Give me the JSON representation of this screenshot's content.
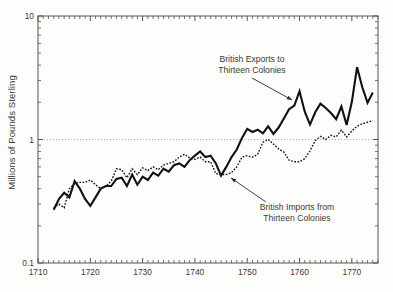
{
  "chart_data": {
    "type": "line",
    "title": "",
    "xlabel": "",
    "ylabel": "Millions of Pounds Sterling",
    "yscale": "log",
    "ylim": [
      0.1,
      10
    ],
    "xlim": [
      1710,
      1775
    ],
    "grid": "single horizontal dotted gridline at y=1",
    "y_tick_labels": [
      "10",
      "1",
      "0.1"
    ],
    "y_tick_values": [
      10,
      1,
      0.1
    ],
    "x_tick_labels": [
      "1710",
      "1720",
      "1730",
      "1740",
      "1750",
      "1760",
      "1770"
    ],
    "x_tick_values": [
      1710,
      1720,
      1730,
      1740,
      1750,
      1760,
      1770
    ],
    "x_minor_tick_interval": 1,
    "legend_position": "inline annotations with arrows",
    "annotations": [
      {
        "name": "exports-annotation",
        "text_line1": "British Exports to",
        "text_line2": "Thirteen Colonies",
        "arrow_from": [
          252,
          78
        ],
        "arrow_to": [
          292,
          100
        ]
      },
      {
        "name": "imports-annotation",
        "text_line1": "British Imports from",
        "text_line2": "Thirteen Colonies",
        "arrow_from": [
          266,
          202
        ],
        "arrow_to": [
          231,
          178
        ]
      }
    ],
    "series": [
      {
        "name": "British Exports to Thirteen Colonies",
        "style": "solid",
        "color": "#111111",
        "linewidth": 2.1,
        "x": [
          1713,
          1714,
          1715,
          1716,
          1717,
          1718,
          1719,
          1720,
          1721,
          1722,
          1723,
          1724,
          1725,
          1726,
          1727,
          1728,
          1729,
          1730,
          1731,
          1732,
          1733,
          1734,
          1735,
          1736,
          1737,
          1738,
          1739,
          1740,
          1741,
          1742,
          1743,
          1744,
          1745,
          1746,
          1747,
          1748,
          1749,
          1750,
          1751,
          1752,
          1753,
          1754,
          1755,
          1756,
          1757,
          1758,
          1759,
          1760,
          1761,
          1762,
          1763,
          1764,
          1765,
          1766,
          1767,
          1768,
          1769,
          1770,
          1771,
          1772,
          1773,
          1774
        ],
        "y": [
          0.27,
          0.33,
          0.37,
          0.34,
          0.46,
          0.4,
          0.33,
          0.29,
          0.34,
          0.4,
          0.42,
          0.42,
          0.48,
          0.49,
          0.42,
          0.52,
          0.43,
          0.5,
          0.47,
          0.54,
          0.51,
          0.58,
          0.55,
          0.62,
          0.64,
          0.6,
          0.68,
          0.74,
          0.8,
          0.72,
          0.74,
          0.64,
          0.51,
          0.6,
          0.72,
          0.83,
          1.03,
          1.22,
          1.15,
          1.2,
          1.12,
          1.28,
          1.11,
          1.25,
          1.48,
          1.76,
          1.88,
          2.46,
          1.68,
          1.32,
          1.66,
          1.95,
          1.8,
          1.64,
          1.46,
          1.85,
          1.31,
          2.02,
          3.85,
          2.65,
          1.98,
          2.4
        ]
      },
      {
        "name": "British Imports from Thirteen Colonies",
        "style": "dotted",
        "color": "#1a1a1a",
        "linewidth": 1.4,
        "x": [
          1713,
          1714,
          1715,
          1716,
          1717,
          1718,
          1719,
          1720,
          1721,
          1722,
          1723,
          1724,
          1725,
          1726,
          1727,
          1728,
          1729,
          1730,
          1731,
          1732,
          1733,
          1734,
          1735,
          1736,
          1737,
          1738,
          1739,
          1740,
          1741,
          1742,
          1743,
          1744,
          1745,
          1746,
          1747,
          1748,
          1749,
          1750,
          1751,
          1752,
          1753,
          1754,
          1755,
          1756,
          1757,
          1758,
          1759,
          1760,
          1761,
          1762,
          1763,
          1764,
          1765,
          1766,
          1767,
          1768,
          1769,
          1770,
          1771,
          1772,
          1773,
          1774
        ],
        "y": [
          0.28,
          0.3,
          0.28,
          0.4,
          0.44,
          0.45,
          0.45,
          0.47,
          0.43,
          0.4,
          0.42,
          0.46,
          0.58,
          0.57,
          0.49,
          0.58,
          0.52,
          0.59,
          0.56,
          0.6,
          0.57,
          0.62,
          0.64,
          0.66,
          0.72,
          0.76,
          0.71,
          0.69,
          0.72,
          0.66,
          0.66,
          0.53,
          0.52,
          0.52,
          0.54,
          0.6,
          0.72,
          0.74,
          0.72,
          0.76,
          0.95,
          1.0,
          0.92,
          0.84,
          0.79,
          0.68,
          0.66,
          0.66,
          0.7,
          0.81,
          0.98,
          1.06,
          1.0,
          1.08,
          1.05,
          1.19,
          1.05,
          1.17,
          1.28,
          1.34,
          1.38,
          1.42
        ]
      }
    ]
  },
  "axes": {
    "y_axis_title": "Millions of Pounds Sterling",
    "y_labels": [
      "10",
      "1",
      "0.1"
    ],
    "x_labels": [
      "1710",
      "1720",
      "1730",
      "1740",
      "1750",
      "1760",
      "1770"
    ]
  },
  "colors": {
    "background": "#fdfdfb",
    "frame": "#555555",
    "text": "#3a3a3a",
    "exports_line": "#111111",
    "imports_line": "#1a1a1a",
    "gridline": "#aaaaaa"
  }
}
